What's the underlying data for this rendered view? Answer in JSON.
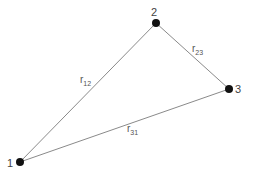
{
  "diagram": {
    "type": "triangle-graph",
    "nodes": [
      {
        "id": "1",
        "label": "1"
      },
      {
        "id": "2",
        "label": "2"
      },
      {
        "id": "3",
        "label": "3"
      }
    ],
    "edges": [
      {
        "from": "1",
        "to": "2",
        "label": "r",
        "subscript": "12"
      },
      {
        "from": "2",
        "to": "3",
        "label": "r",
        "subscript": "23"
      },
      {
        "from": "3",
        "to": "1",
        "label": "r",
        "subscript": "31"
      }
    ],
    "colors": {
      "edge": "#8a8a8a",
      "node": "#111111",
      "text": "#444444"
    }
  }
}
